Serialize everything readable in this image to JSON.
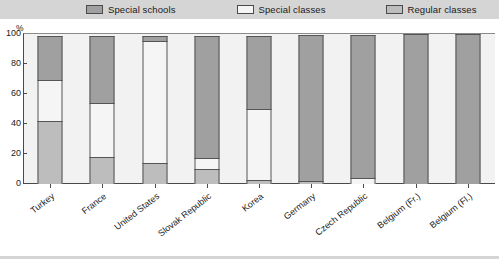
{
  "legend": {
    "items": [
      {
        "label": "Special schools",
        "color": "#a0a0a0",
        "icon": "legend-swatch-icon"
      },
      {
        "label": "Special classes",
        "color": "#f5f5f5",
        "icon": "legend-swatch-icon"
      },
      {
        "label": "Regular classes",
        "color": "#bdbdbd",
        "icon": "legend-swatch-icon"
      }
    ]
  },
  "axes": {
    "y_unit": "%",
    "y_ticks": [
      "100",
      "80",
      "60",
      "40",
      "20",
      "0"
    ]
  },
  "chart_data": {
    "type": "bar",
    "subtype": "stacked-100-percent",
    "title": "",
    "xlabel": "",
    "ylabel": "%",
    "ylim": [
      0,
      100
    ],
    "grid": false,
    "legend_position": "top",
    "categories": [
      "Turkey",
      "France",
      "United States",
      "Slovak Republic",
      "Korea",
      "Germany",
      "Czech Republic",
      "Belgium (Fr.)",
      "Belgium (Fl.)"
    ],
    "series": [
      {
        "name": "Special schools",
        "color": "#a0a0a0",
        "values": [
          30,
          45,
          4,
          82,
          49,
          98,
          96,
          100,
          100
        ]
      },
      {
        "name": "Special classes",
        "color": "#f5f5f5",
        "values": [
          28,
          37,
          82,
          8,
          48,
          0,
          4,
          0,
          0
        ]
      },
      {
        "name": "Regular classes",
        "color": "#bdbdbd",
        "values": [
          42,
          18,
          14,
          10,
          3,
          2,
          0,
          0,
          0
        ]
      }
    ],
    "stack_boundaries": [
      {
        "category": "Turkey",
        "regular_top": 42,
        "special_classes_top": 70
      },
      {
        "category": "France",
        "regular_top": 18,
        "special_classes_top": 55
      },
      {
        "category": "United States",
        "regular_top": 14,
        "special_classes_top": 96
      },
      {
        "category": "Slovak Republic",
        "regular_top": 10,
        "special_classes_top": 18
      },
      {
        "category": "Korea",
        "regular_top": 3,
        "special_classes_top": 51
      },
      {
        "category": "Germany",
        "regular_top": 2,
        "special_classes_top": 2
      },
      {
        "category": "Czech Republic",
        "regular_top": 0,
        "special_classes_top": 4
      },
      {
        "category": "Belgium (Fr.)",
        "regular_top": 0,
        "special_classes_top": 0
      },
      {
        "category": "Belgium (Fl.)",
        "regular_top": 0,
        "special_classes_top": 0
      }
    ]
  }
}
